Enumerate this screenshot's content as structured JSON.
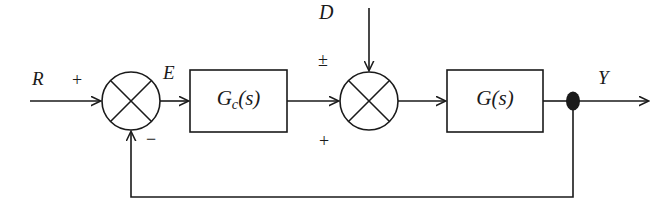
{
  "diagram": {
    "canvas": {
      "width": 654,
      "height": 211,
      "background": "#ffffff"
    },
    "line_color": "#1a1a1a",
    "signals": {
      "reference": "R",
      "error": "E",
      "disturbance": "D",
      "output": "Y"
    },
    "signs": {
      "reference_sign": "+",
      "feedback_sign": "−",
      "disturbance_sign": "±",
      "forward_sign": "+"
    },
    "blocks": [
      {
        "id": "controller",
        "label_main": "G",
        "label_sub": "c",
        "label_arg": "(s)",
        "label_text": "Gc(s)"
      },
      {
        "id": "plant",
        "label_main": "G",
        "label_sub": "",
        "label_arg": "(s)",
        "label_text": "G(s)"
      }
    ],
    "junctions": [
      {
        "id": "sum-1",
        "type": "summing-junction",
        "style": "circle-with-x"
      },
      {
        "id": "sum-2",
        "type": "summing-junction",
        "style": "circle-with-x"
      }
    ],
    "nodes": [
      {
        "id": "takeoff",
        "type": "takeoff-point",
        "style": "filled-ellipse"
      }
    ]
  }
}
